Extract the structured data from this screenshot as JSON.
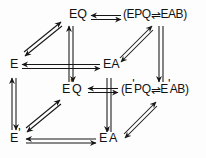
{
  "figure": {
    "kind": "commutative-cube-diagram",
    "stroke_color": "#161616",
    "background_color": "#fdfdfd"
  },
  "nodes": {
    "eq": {
      "label": "EQ",
      "x": 68,
      "y": 12
    },
    "epq_eab": {
      "label": "(EPQ⇆EAB)",
      "x": 124,
      "y": 12
    },
    "e": {
      "label": "E",
      "x": 10,
      "y": 62
    },
    "ea": {
      "label": "EA",
      "x": 104,
      "y": 62
    },
    "epq_prime": {
      "label": "E'Q",
      "x": 62,
      "y": 86
    },
    "eppq_eab": {
      "label": "(E'PQ⇆E'AB)",
      "x": 122,
      "y": 86
    },
    "e_prime": {
      "label": "E'",
      "x": 10,
      "y": 136
    },
    "ea_prime": {
      "label": "E'A",
      "x": 100,
      "y": 136
    }
  },
  "node_parts": {
    "eq": {
      "text": "EQ"
    },
    "epq_eab": {
      "open": "(",
      "left": "EPQ",
      "arrow": "⇌",
      "right": "EAB",
      "close": ")"
    },
    "e": {
      "text": "E"
    },
    "ea": {
      "text": "EA"
    },
    "epq_prime": {
      "base": "E",
      "prime": "'",
      "tail": "Q"
    },
    "eppq_eab": {
      "open": "(",
      "left_base": "E",
      "left_prime": "'",
      "left_tail": "PQ",
      "arrow": "⇌",
      "right_base": "E",
      "right_prime": "'",
      "right_tail": "AB",
      "close": ")"
    },
    "e_prime": {
      "base": "E",
      "prime": "'"
    },
    "ea_prime": {
      "base": "E",
      "prime": "'",
      "tail": "A"
    }
  },
  "edges": [
    {
      "name": "edge-eq-to-epqeab",
      "from": "eq",
      "to": "epq_eab",
      "style": "double-line-right-arrow-and-left-arrow",
      "orientation": "horizontal-top"
    },
    {
      "name": "edge-e-to-eq",
      "from": "e",
      "to": "eq",
      "style": "double-headed-diagonal",
      "orientation": "diagonal-up-right"
    },
    {
      "name": "edge-e-to-ea",
      "from": "e",
      "to": "ea",
      "style": "double-line-both-arrows",
      "orientation": "horizontal-middle"
    },
    {
      "name": "edge-eq-to-epqprime",
      "from": "eq",
      "to": "epq_prime",
      "style": "double-line-both-arrows",
      "orientation": "vertical-center"
    },
    {
      "name": "edge-ea-to-epqeab",
      "from": "ea",
      "to": "epq_eab",
      "style": "double-headed-diagonal",
      "orientation": "diagonal-up-right"
    },
    {
      "name": "edge-epqeab-to-eppqeab",
      "from": "epq_eab",
      "to": "eppq_eab",
      "style": "double-line-down-arrow",
      "orientation": "vertical-right"
    },
    {
      "name": "edge-epqprime-to-eppqeab",
      "from": "epq_prime",
      "to": "eppq_eab",
      "style": "double-line-both-arrows",
      "orientation": "horizontal-inner"
    },
    {
      "name": "edge-e-to-eprime",
      "from": "e",
      "to": "e_prime",
      "style": "double-line-both-arrows",
      "orientation": "vertical-left"
    },
    {
      "name": "edge-eprime-to-epqprime",
      "from": "e_prime",
      "to": "epq_prime",
      "style": "double-headed-diagonal",
      "orientation": "diagonal-up-right"
    },
    {
      "name": "edge-eprime-to-eaprime",
      "from": "e_prime",
      "to": "ea_prime",
      "style": "double-line-both-arrows",
      "orientation": "horizontal-bottom"
    },
    {
      "name": "edge-ea-to-eaprime",
      "from": "ea",
      "to": "ea_prime",
      "style": "double-line-down-arrow",
      "orientation": "vertical-center-lower"
    },
    {
      "name": "edge-eaprime-to-eppqeab",
      "from": "ea_prime",
      "to": "eppq_eab",
      "style": "double-headed-diagonal",
      "orientation": "diagonal-up-right"
    }
  ]
}
